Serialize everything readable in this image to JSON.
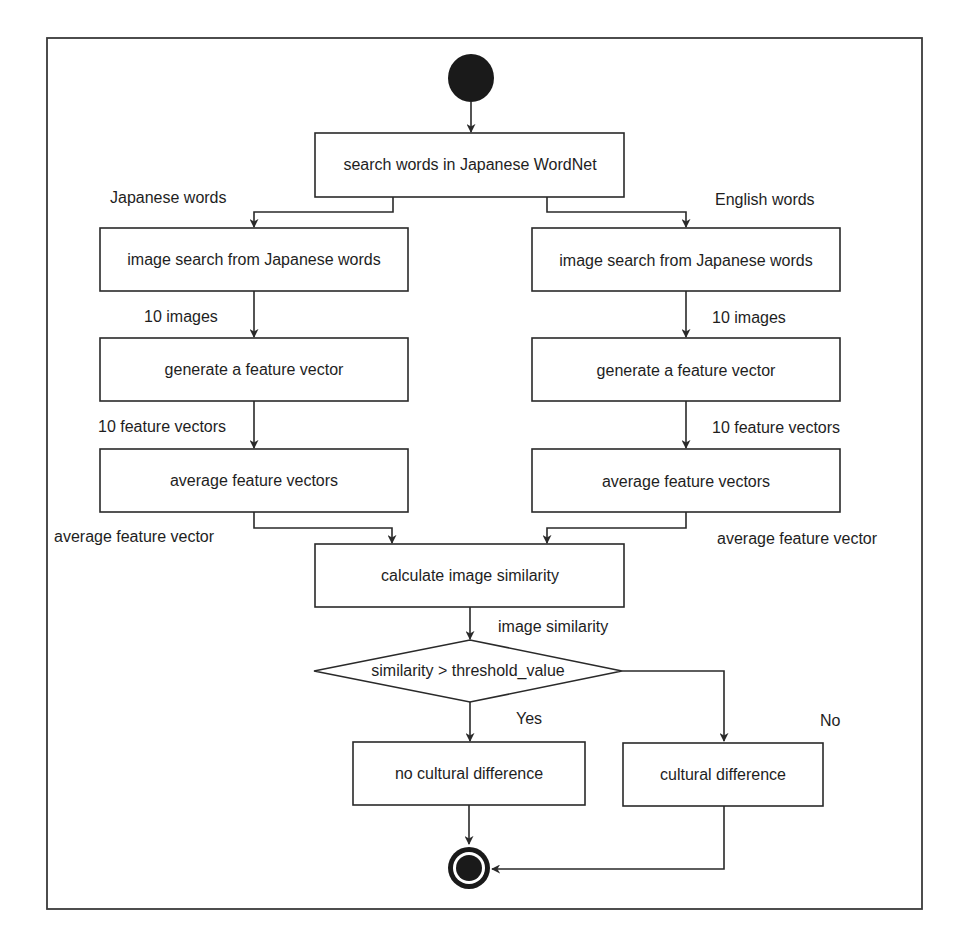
{
  "diagram": {
    "type": "UML activity diagram",
    "start_node": {
      "icon": "initial-node-filled-circle"
    },
    "end_node": {
      "icon": "final-node-bullseye"
    },
    "nodes": {
      "search": "search words in Japanese WordNet",
      "left_image_search": "image search from Japanese words",
      "right_image_search": "image search from Japanese words",
      "left_generate": "generate a feature vector",
      "right_generate": "generate a feature vector",
      "left_average": "average feature vectors",
      "right_average": "average feature vectors",
      "calculate": "calculate image similarity",
      "decision": "similarity > threshold_value",
      "no_difference": "no cultural difference",
      "difference": "cultural difference"
    },
    "edge_labels": {
      "japanese_words": "Japanese words",
      "english_words": "English words",
      "left_10_images": "10 images",
      "right_10_images": "10 images",
      "left_10_vectors": "10 feature vectors",
      "right_10_vectors": "10 feature vectors",
      "left_avg_vector": "average feature vector",
      "right_avg_vector": "average feature vector",
      "image_similarity": "image similarity",
      "yes": "Yes",
      "no": "No"
    },
    "colors": {
      "stroke": "#2a2a2a",
      "fill": "#ffffff",
      "node_fill_dark": "#1a1a1a"
    }
  }
}
